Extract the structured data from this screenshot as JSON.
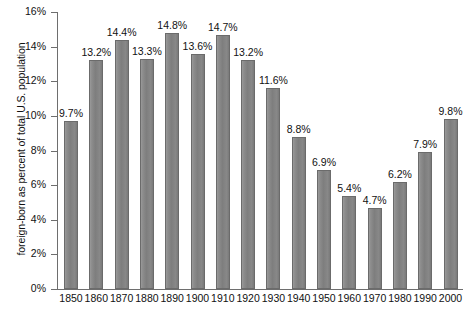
{
  "chart_data": {
    "type": "bar",
    "title": "",
    "xlabel": "",
    "ylabel": "foreign-born as percent of total U.S. population",
    "categories": [
      "1850",
      "1860",
      "1870",
      "1880",
      "1890",
      "1900",
      "1910",
      "1920",
      "1930",
      "1940",
      "1950",
      "1960",
      "1970",
      "1980",
      "1990",
      "2000"
    ],
    "values": [
      9.7,
      13.2,
      14.4,
      13.3,
      14.8,
      13.6,
      14.7,
      13.2,
      11.6,
      8.8,
      6.9,
      5.4,
      4.7,
      6.2,
      7.9,
      9.8
    ],
    "value_labels": [
      "9.7%",
      "13.2%",
      "14.4%",
      "13.3%",
      "14.8%",
      "13.6%",
      "14.7%",
      "13.2%",
      "11.6%",
      "8.8%",
      "6.9%",
      "5.4%",
      "4.7%",
      "6.2%",
      "7.9%",
      "9.8%"
    ],
    "ylim": [
      0,
      16
    ],
    "ytick_labels": [
      "0%",
      "2%",
      "4%",
      "6%",
      "8%",
      "10%",
      "12%",
      "14%",
      "16%"
    ],
    "ytick_values": [
      0,
      2,
      4,
      6,
      8,
      10,
      12,
      14,
      16
    ],
    "grid": false,
    "legend": null,
    "bar_color": "#848484",
    "axis_color": "#6e6e6e",
    "background": "#ffffff"
  }
}
